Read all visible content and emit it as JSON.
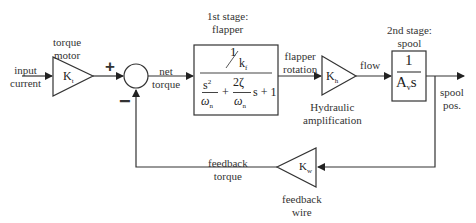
{
  "diagram": {
    "labels": {
      "input": [
        "input",
        "current"
      ],
      "torque_motor": [
        "torque",
        "motor"
      ],
      "plus": "+",
      "minus": "−",
      "net_torque": [
        "net",
        "torque"
      ],
      "first_stage": [
        "1st stage:",
        "flapper"
      ],
      "flapper_rotation": [
        "flapper",
        "rotation"
      ],
      "hydraulic": [
        "Hydraulic",
        "amplification"
      ],
      "flow": "flow",
      "second_stage": [
        "2nd stage:",
        "spool"
      ],
      "spool_pos": [
        "spool",
        "pos."
      ],
      "feedback_torque": [
        "feedback",
        "torque"
      ],
      "feedback_wire": [
        "feedback",
        "wire"
      ]
    },
    "blocks": {
      "torque_motor_gain": {
        "symbol": "K",
        "sub": "t"
      },
      "flapper_tf": {
        "num_top": "1",
        "num_bottom": "k",
        "num_bottom_sub": "f",
        "den_s": "s",
        "den_s_sup": "2",
        "den_wn": "ω",
        "den_wn_sub": "n",
        "den_wn_sup": "2",
        "plus1": "+",
        "zeta_num": "2ζ",
        "zeta_den": "ω",
        "zeta_den_sub": "n",
        "tail": "s + 1"
      },
      "hydraulic_gain": {
        "symbol": "K",
        "sub": "h"
      },
      "spool_tf": {
        "num": "1",
        "den": "A",
        "den_sub": "v",
        "den_tail": "s"
      },
      "feedback_gain": {
        "symbol": "K",
        "sub": "w"
      }
    }
  }
}
